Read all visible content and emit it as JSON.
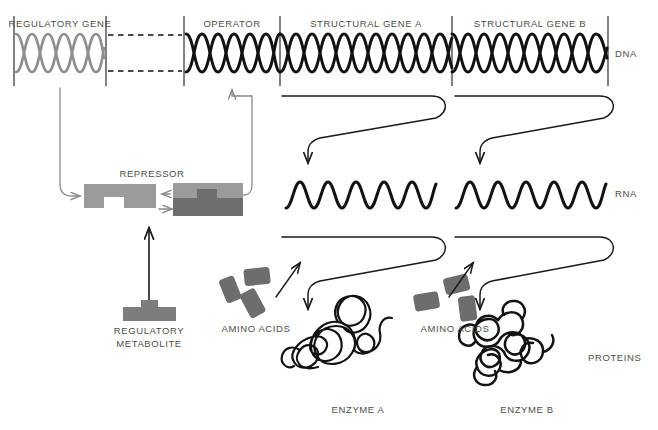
{
  "diagram": {
    "colors": {
      "dna_dark": "#121212",
      "dna_light": "#8f8f8f",
      "repressor_light": "#9b9b9b",
      "repressor_dark": "#6e6e6e",
      "metabolite": "#7d7d7d",
      "amino_acid": "#6d6d6d",
      "text": "#4d4d4d",
      "rule": "#1a1a1a",
      "background": "#ffffff"
    },
    "dna_strip": {
      "segments": [
        {
          "id": "regulatory-gene",
          "label": "REGULATORY GENE",
          "helix": "double",
          "color": "light",
          "x": 14,
          "width": 92
        },
        {
          "id": "spacer",
          "label": "",
          "helix": "dashed",
          "color": "dark",
          "x": 106,
          "width": 78
        },
        {
          "id": "operator",
          "label": "OPERATOR",
          "helix": "double",
          "color": "dark",
          "x": 184,
          "width": 96
        },
        {
          "id": "structural-gene-a",
          "label": "STRUCTURAL GENE A",
          "helix": "double",
          "color": "dark",
          "x": 280,
          "width": 172
        },
        {
          "id": "structural-gene-b",
          "label": "STRUCTURAL GENE B",
          "helix": "double",
          "color": "dark",
          "x": 452,
          "width": 156
        }
      ],
      "row_label": "DNA"
    },
    "rna_row": {
      "row_label": "RNA",
      "strands": [
        {
          "id": "rna-a",
          "x": 286,
          "width": 150
        },
        {
          "id": "rna-b",
          "x": 456,
          "width": 150
        }
      ]
    },
    "protein_row": {
      "row_label": "PROTEINS",
      "items": [
        {
          "id": "enzyme-a",
          "label": "ENZYME A"
        },
        {
          "id": "enzyme-b",
          "label": "ENZYME B"
        }
      ]
    },
    "amino_acid_groups": [
      {
        "id": "amino-acids-a",
        "label": "AMINO ACIDS",
        "count": 3
      },
      {
        "id": "amino-acids-b",
        "label": "AMINO ACIDS",
        "count": 3
      }
    ],
    "repressor": {
      "label": "REPRESSOR",
      "inactive_form": {
        "id": "repressor-inactive",
        "notch": "bottom"
      },
      "active_form": {
        "id": "repressor-active",
        "notch": "filled"
      }
    },
    "regulatory_metabolite": {
      "label_line1": "REGULATORY",
      "label_line2": "METABOLITE"
    },
    "arrows": [
      {
        "id": "arrow-regulatory-gene-to-repressor",
        "kind": "elbow"
      },
      {
        "id": "arrow-repressor-to-operator",
        "kind": "elbow"
      },
      {
        "id": "arrow-active-to-inactive",
        "kind": "straight-left"
      },
      {
        "id": "arrow-inactive-to-active",
        "kind": "straight-right"
      },
      {
        "id": "arrow-metabolite-to-repressor",
        "kind": "straight-up"
      },
      {
        "id": "arrow-transcription-a",
        "kind": "s-curve"
      },
      {
        "id": "arrow-transcription-b",
        "kind": "s-curve"
      },
      {
        "id": "arrow-translation-a",
        "kind": "s-curve"
      },
      {
        "id": "arrow-translation-b",
        "kind": "s-curve"
      },
      {
        "id": "arrow-amino-acids-a-to-enzyme",
        "kind": "diagonal"
      },
      {
        "id": "arrow-amino-acids-b-to-enzyme",
        "kind": "diagonal"
      }
    ]
  }
}
